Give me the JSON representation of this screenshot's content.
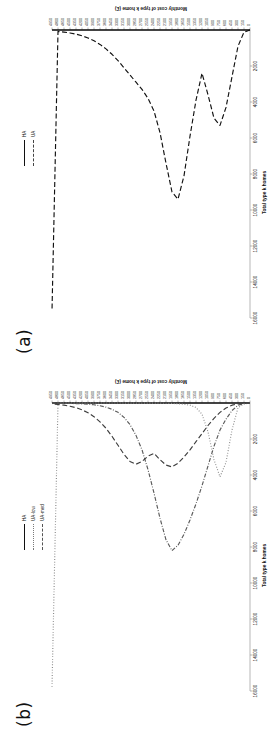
{
  "figure": {
    "orientation": "rotated-90-ccw",
    "panels": [
      {
        "id": "b",
        "label": "(b)",
        "legend": [
          {
            "name": "HA",
            "style": "solid",
            "color": "#111111"
          },
          {
            "name": "UA-low",
            "style": "dotted",
            "color": "#7a7a7a"
          },
          {
            "name": "UA-med",
            "style": "dashdot",
            "color": "#555555"
          },
          {
            "name": "UA-high",
            "style": "dashed",
            "color": "#444444"
          }
        ]
      },
      {
        "id": "a",
        "label": "(a)",
        "legend": [
          {
            "name": "HA",
            "style": "solid",
            "color": "#111111"
          },
          {
            "name": "UA",
            "style": "dashed",
            "color": "#111111"
          }
        ]
      }
    ]
  },
  "chart_data": [
    {
      "panel": "b",
      "type": "line",
      "title": "",
      "xlabel": "Monthly cost of type k home (£)",
      "ylabel": "Total type k homes",
      "xlim": [
        0,
        4950
      ],
      "ylim": [
        0,
        16000
      ],
      "grid": false,
      "legend_position": "top-right",
      "categories": [
        0,
        150,
        300,
        450,
        600,
        750,
        900,
        1050,
        1200,
        1350,
        1500,
        1650,
        1800,
        1950,
        2100,
        2250,
        2400,
        2550,
        2700,
        2850,
        3000,
        3150,
        3300,
        3450,
        3600,
        3750,
        3900,
        4050,
        4200,
        4350,
        4500,
        4650,
        4800,
        4950
      ],
      "yticks": [
        0,
        2000,
        4000,
        6000,
        8000,
        10000,
        12000,
        14000,
        16000
      ],
      "series": [
        {
          "name": "HA",
          "style": "solid",
          "values": [
            0,
            0,
            0,
            0,
            0,
            0,
            0,
            0,
            0,
            0,
            0,
            0,
            0,
            0,
            0,
            0,
            0,
            0,
            0,
            0,
            0,
            0,
            0,
            0,
            0,
            0,
            0,
            0,
            0,
            0,
            0,
            0,
            0,
            0
          ]
        },
        {
          "name": "UA-low",
          "style": "dotted",
          "values": [
            0,
            60,
            260,
            1500,
            3300,
            4100,
            3150,
            1600,
            620,
            250,
            120,
            70,
            40,
            25,
            15,
            10,
            8,
            6,
            5,
            4,
            3,
            3,
            2,
            2,
            2,
            1,
            1,
            1,
            1,
            1,
            1,
            1,
            1,
            15800
          ]
        },
        {
          "name": "UA-med",
          "style": "dashdot",
          "values": [
            0,
            30,
            120,
            420,
            900,
            1500,
            2400,
            3500,
            4600,
            5600,
            6500,
            7300,
            7900,
            8200,
            7600,
            6400,
            5000,
            3700,
            2600,
            1800,
            1200,
            800,
            520,
            350,
            230,
            150,
            100,
            70,
            50,
            35,
            25,
            18,
            12,
            9
          ]
        },
        {
          "name": "UA-high",
          "style": "dashed",
          "values": [
            0,
            10,
            40,
            120,
            280,
            520,
            850,
            1250,
            1700,
            2150,
            2600,
            3000,
            3350,
            3550,
            3450,
            3150,
            2800,
            2950,
            3250,
            3400,
            3250,
            2850,
            2350,
            1850,
            1400,
            1050,
            760,
            540,
            380,
            260,
            180,
            120,
            80,
            55
          ]
        }
      ]
    },
    {
      "panel": "a",
      "type": "line",
      "title": "",
      "xlabel": "Monthly cost of type k home (£)",
      "ylabel": "Total type k homes",
      "xlim": [
        0,
        4950
      ],
      "ylim": [
        0,
        16000
      ],
      "grid": false,
      "legend_position": "top-right",
      "categories": [
        0,
        150,
        300,
        450,
        600,
        750,
        900,
        1050,
        1200,
        1350,
        1500,
        1650,
        1800,
        1950,
        2100,
        2250,
        2400,
        2550,
        2700,
        2850,
        3000,
        3150,
        3300,
        3450,
        3600,
        3750,
        3900,
        4050,
        4200,
        4350,
        4500,
        4650,
        4800,
        4950
      ],
      "yticks": [
        0,
        2000,
        4000,
        6000,
        8000,
        10000,
        12000,
        14000,
        16000
      ],
      "series": [
        {
          "name": "HA",
          "style": "solid",
          "values": [
            0,
            0,
            0,
            0,
            0,
            0,
            0,
            0,
            0,
            0,
            0,
            0,
            0,
            0,
            0,
            0,
            0,
            0,
            0,
            0,
            0,
            0,
            0,
            0,
            0,
            0,
            0,
            0,
            0,
            0,
            0,
            0,
            0,
            0
          ]
        },
        {
          "name": "UA",
          "style": "dashed",
          "values": [
            0,
            120,
            900,
            2600,
            4300,
            5300,
            4900,
            3600,
            2400,
            3900,
            5900,
            8100,
            9400,
            9000,
            7400,
            5700,
            4500,
            3800,
            3300,
            2900,
            2500,
            2100,
            1700,
            1350,
            1050,
            800,
            600,
            440,
            320,
            230,
            165,
            115,
            80,
            15600
          ]
        }
      ]
    }
  ],
  "axes": {
    "category_axis_title": "Monthly cost of type k home (£)",
    "value_axis_title": "Total type k homes",
    "category_ticks": [
      "0",
      "150",
      "300",
      "450",
      "600",
      "750",
      "900",
      "1050",
      "1200",
      "1350",
      "1500",
      "1650",
      "1800",
      "1950",
      "2100",
      "2250",
      "2400",
      "2550",
      "2700",
      "2850",
      "3000",
      "3150",
      "3300",
      "3450",
      "3600",
      "3750",
      "3900",
      "4050",
      "4200",
      "4350",
      "4500",
      "4650",
      "4800",
      "4950"
    ],
    "value_ticks": [
      "2000",
      "4000",
      "6000",
      "8000",
      "10000",
      "12000",
      "14000",
      "16000"
    ]
  }
}
